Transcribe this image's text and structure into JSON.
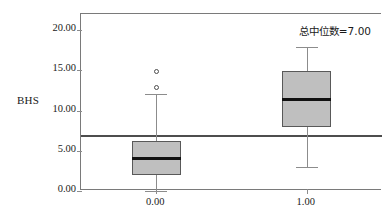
{
  "chart_data": {
    "type": "box",
    "title": "",
    "xlabel": "",
    "ylabel": "BHS",
    "ylim": [
      0.0,
      22.0
    ],
    "yticks": [
      0.0,
      5.0,
      10.0,
      15.0,
      20.0
    ],
    "ytick_labels": [
      "0.00",
      "5.00",
      "10.00",
      "15.00",
      "20.00"
    ],
    "categories": [
      "0.00",
      "1.00"
    ],
    "grid": false,
    "legend": null,
    "annotations": [
      {
        "name": "overall-median-label",
        "text": "总中位数=7.00",
        "value": 7.0,
        "position": "top-right"
      }
    ],
    "reference_line": {
      "name": "overall-median-line",
      "value": 7.0,
      "orientation": "horizontal",
      "color": "#4d4d4d"
    },
    "boxes": [
      {
        "category": "0.00",
        "whisker_low": 0.0,
        "q1": 2.0,
        "median": 4.1,
        "q3": 6.2,
        "whisker_high": 12.0,
        "outliers": [
          12.9,
          14.9
        ],
        "fill_color": "#bfbfbf",
        "edge_color": "#595959"
      },
      {
        "category": "1.00",
        "whisker_low": 3.0,
        "q1": 8.0,
        "median": 11.4,
        "q3": 14.9,
        "whisker_high": 17.9,
        "outliers": [],
        "fill_color": "#bfbfbf",
        "edge_color": "#595959"
      }
    ]
  },
  "colors": {
    "box_fill": "#bfbfbf",
    "box_edge": "#595959",
    "median": "#111111",
    "whisker": "#8c8c8c",
    "axis": "#7a7a7a",
    "reference_line": "#4d4d4d",
    "text": "#1a1a1a",
    "background": "#ffffff"
  }
}
